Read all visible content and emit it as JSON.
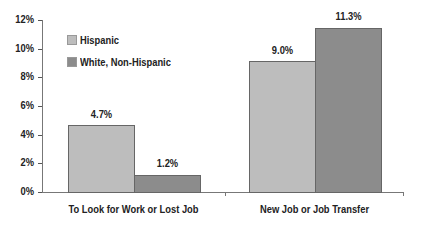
{
  "chart_data": {
    "type": "bar",
    "title": "",
    "xlabel": "",
    "ylabel": "",
    "categories": [
      "To Look for Work or Lost Job",
      "New Job or Job Transfer"
    ],
    "series": [
      {
        "name": "Hispanic",
        "values": [
          4.7,
          9.0
        ],
        "labels": [
          "4.7%",
          "9.0%"
        ],
        "color": "#bdbdbd"
      },
      {
        "name": "White, Non-Hispanic",
        "values": [
          1.2,
          11.3
        ],
        "labels": [
          "1.2%",
          "11.3%"
        ],
        "color": "#8c8c8c"
      }
    ],
    "ylim": [
      0,
      12
    ],
    "yticks": [
      "0%",
      "2%",
      "4%",
      "6%",
      "8%",
      "10%",
      "12%"
    ],
    "grid": false,
    "legend_position": "upper-left-inside"
  },
  "legend": {
    "hispanic": "Hispanic",
    "white": "White, Non-Hispanic"
  },
  "colors": {
    "hispanic": "#bdbdbd",
    "white": "#8c8c8c",
    "axis": "#777777"
  }
}
